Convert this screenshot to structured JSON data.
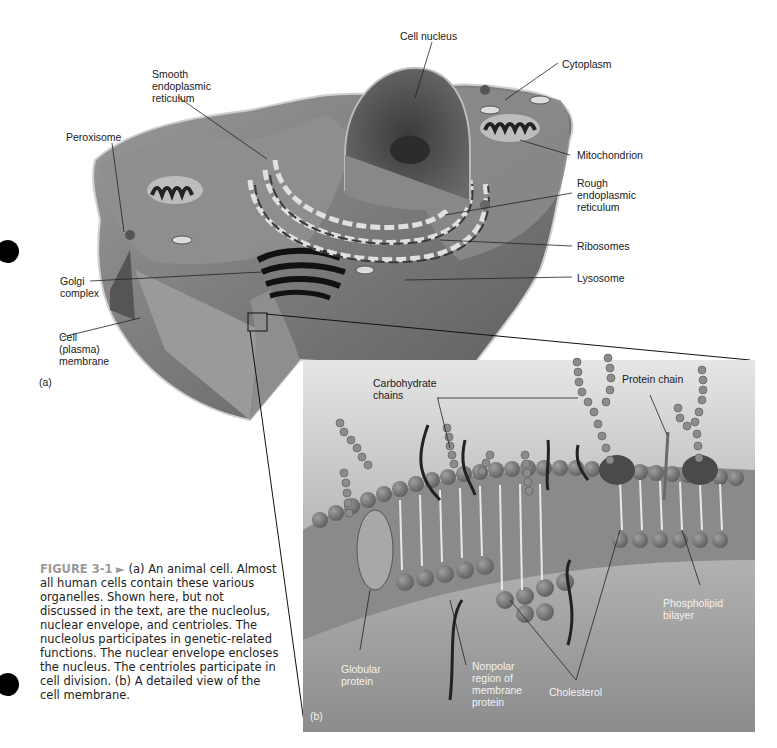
{
  "figure": {
    "number": "FIGURE 3-1",
    "arrow": "►",
    "caption": "(a) An animal cell. Almost all human cells contain these various organelles. Shown here, but not discussed in the text, are the nucleolus, nuclear envelope, and centrioles. The nucleolus participates in genetic-related functions. The nuclear envelope encloses the nucleus. The centrioles participate in cell division. (b) A detailed view of the cell membrane."
  },
  "panel_a": {
    "tag": "(a)",
    "labels": {
      "cell_nucleus": "Cell nucleus",
      "smooth_er": "Smooth\nendoplasmic\nreticulum",
      "cytoplasm": "Cytoplasm",
      "peroxisome": "Peroxisome",
      "mitochondrion": "Mitochondrion",
      "rough_er": "Rough\nendoplasmic\nreticulum",
      "ribosomes": "Ribosomes",
      "golgi": "Golgi\ncomplex",
      "lysosome": "Lysosome",
      "cell_membrane": "Cell\n(plasma)\nmembrane"
    }
  },
  "panel_b": {
    "tag": "(b)",
    "labels": {
      "carbohydrate_chains": "Carbohydrate\nchains",
      "protein_chain": "Protein chain",
      "phospholipid_bilayer": "Phospholipid\nbilayer",
      "globular_protein": "Globular\nprotein",
      "nonpolar_region": "Nonpolar\nregion of\nmembrane\nprotein",
      "cholesterol": "Cholesterol"
    }
  },
  "colors": {
    "cell_body": "#8a8a8a",
    "cell_dark": "#4a4a4a",
    "panel_bg": "#9c9c9c",
    "panel_top": "#d8d8d8",
    "lipid_head": "#7d7d7d",
    "caption_num": "#9a9a9a"
  }
}
